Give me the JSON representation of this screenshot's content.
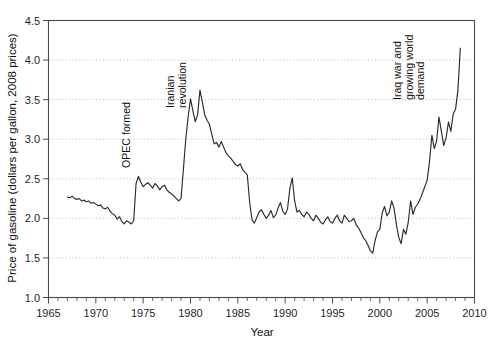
{
  "chart_data": {
    "type": "line",
    "title": "",
    "xlabel": "Year",
    "ylabel": "Price of gasoline (dollars per gallon, 2008 prices)",
    "xlim": [
      1965,
      2010
    ],
    "ylim": [
      1.0,
      4.5
    ],
    "xticks": [
      1965,
      1970,
      1975,
      1980,
      1985,
      1990,
      1995,
      2000,
      2005,
      2010
    ],
    "xticklabels": [
      "1965",
      "1970",
      "1975",
      "1980",
      "1985",
      "1990",
      "1995",
      "2000",
      "2005",
      "2010"
    ],
    "yticks": [
      1.0,
      1.5,
      2.0,
      2.5,
      3.0,
      3.5,
      4.0,
      4.5
    ],
    "yticklabels": [
      "1.0",
      "1.5",
      "2.0",
      "2.5",
      "3.0",
      "3.5",
      "4.0",
      "4.5"
    ],
    "minor_xtick_interval": 1,
    "grid": "horizontal-dotted",
    "legend": "none",
    "line_color": "#2b2b2b",
    "grid_color": "#bdbdbd",
    "axis_color": "#4a4a4a",
    "series": [
      {
        "name": "Price of gasoline (2008 dollars per gallon)",
        "x": [
          1967.0,
          1967.25,
          1967.5,
          1967.75,
          1968.0,
          1968.25,
          1968.5,
          1968.75,
          1969.0,
          1969.25,
          1969.5,
          1969.75,
          1970.0,
          1970.25,
          1970.5,
          1970.75,
          1971.0,
          1971.25,
          1971.5,
          1971.75,
          1972.0,
          1972.25,
          1972.5,
          1972.75,
          1973.0,
          1973.25,
          1973.5,
          1973.75,
          1974.0,
          1974.25,
          1974.5,
          1974.75,
          1975.0,
          1975.25,
          1975.5,
          1975.75,
          1976.0,
          1976.25,
          1976.5,
          1976.75,
          1977.0,
          1977.25,
          1977.5,
          1977.75,
          1978.0,
          1978.25,
          1978.5,
          1978.75,
          1979.0,
          1979.25,
          1979.5,
          1979.75,
          1980.0,
          1980.25,
          1980.5,
          1980.75,
          1981.0,
          1981.25,
          1981.5,
          1981.75,
          1982.0,
          1982.25,
          1982.5,
          1982.75,
          1983.0,
          1983.25,
          1983.5,
          1983.75,
          1984.0,
          1984.25,
          1984.5,
          1984.75,
          1985.0,
          1985.25,
          1985.5,
          1985.75,
          1986.0,
          1986.25,
          1986.5,
          1986.75,
          1987.0,
          1987.25,
          1987.5,
          1987.75,
          1988.0,
          1988.25,
          1988.5,
          1988.75,
          1989.0,
          1989.25,
          1989.5,
          1989.75,
          1990.0,
          1990.25,
          1990.5,
          1990.75,
          1991.0,
          1991.25,
          1991.5,
          1991.75,
          1992.0,
          1992.25,
          1992.5,
          1992.75,
          1993.0,
          1993.25,
          1993.5,
          1993.75,
          1994.0,
          1994.25,
          1994.5,
          1994.75,
          1995.0,
          1995.25,
          1995.5,
          1995.75,
          1996.0,
          1996.25,
          1996.5,
          1996.75,
          1997.0,
          1997.25,
          1997.5,
          1997.75,
          1998.0,
          1998.25,
          1998.5,
          1998.75,
          1999.0,
          1999.25,
          1999.5,
          1999.75,
          2000.0,
          2000.25,
          2000.5,
          2000.75,
          2001.0,
          2001.25,
          2001.5,
          2001.75,
          2002.0,
          2002.25,
          2002.5,
          2002.75,
          2003.0,
          2003.25,
          2003.5,
          2003.75,
          2004.0,
          2004.25,
          2004.5,
          2004.75,
          2005.0,
          2005.25,
          2005.5,
          2005.75,
          2006.0,
          2006.25,
          2006.5,
          2006.75,
          2007.0,
          2007.25,
          2007.5,
          2007.75,
          2008.0,
          2008.25,
          2008.5
        ],
        "y": [
          2.27,
          2.26,
          2.28,
          2.25,
          2.24,
          2.25,
          2.22,
          2.23,
          2.21,
          2.22,
          2.19,
          2.2,
          2.18,
          2.16,
          2.17,
          2.13,
          2.12,
          2.14,
          2.09,
          2.06,
          2.04,
          1.99,
          2.02,
          1.96,
          1.93,
          1.97,
          1.95,
          1.93,
          1.97,
          2.44,
          2.53,
          2.46,
          2.4,
          2.43,
          2.45,
          2.42,
          2.38,
          2.44,
          2.41,
          2.36,
          2.4,
          2.42,
          2.36,
          2.33,
          2.31,
          2.28,
          2.25,
          2.22,
          2.25,
          2.62,
          3.0,
          3.28,
          3.51,
          3.36,
          3.22,
          3.31,
          3.62,
          3.47,
          3.31,
          3.24,
          3.19,
          3.06,
          2.94,
          2.96,
          2.9,
          2.97,
          2.9,
          2.83,
          2.79,
          2.76,
          2.72,
          2.68,
          2.66,
          2.69,
          2.62,
          2.58,
          2.55,
          2.2,
          1.98,
          1.94,
          2.01,
          2.08,
          2.11,
          2.05,
          2.0,
          2.04,
          2.1,
          2.01,
          2.04,
          2.13,
          2.2,
          2.09,
          2.05,
          2.12,
          2.38,
          2.51,
          2.22,
          2.08,
          2.1,
          2.05,
          2.02,
          2.08,
          2.05,
          2.0,
          1.97,
          2.04,
          2.0,
          1.95,
          1.93,
          1.98,
          2.02,
          1.96,
          1.94,
          2.0,
          2.04,
          1.97,
          1.94,
          2.04,
          2.0,
          1.96,
          1.97,
          2.0,
          1.92,
          1.88,
          1.82,
          1.76,
          1.72,
          1.66,
          1.59,
          1.56,
          1.72,
          1.83,
          1.86,
          2.07,
          2.15,
          2.03,
          2.08,
          2.22,
          2.13,
          1.92,
          1.76,
          1.68,
          1.86,
          1.8,
          1.95,
          2.22,
          2.05,
          2.14,
          2.18,
          2.24,
          2.32,
          2.4,
          2.48,
          2.72,
          3.05,
          2.88,
          2.98,
          3.28,
          3.1,
          2.92,
          3.02,
          3.22,
          3.1,
          3.32,
          3.38,
          3.62,
          4.15
        ]
      }
    ],
    "annotations": [
      {
        "id": "opec-formed",
        "text_lines": [
          "OPEC formed"
        ],
        "x_year": 1973.6,
        "rotation": -90
      },
      {
        "id": "iranian-revolution",
        "text_lines": [
          "Iranian",
          "revolution"
        ],
        "x_year": 1979.5,
        "rotation": -90
      },
      {
        "id": "iraq-war-growing-world-demand",
        "text_lines": [
          "Iraq war and",
          "growing world",
          "demand"
        ],
        "x_year": 2004.7,
        "rotation": -90
      }
    ]
  }
}
